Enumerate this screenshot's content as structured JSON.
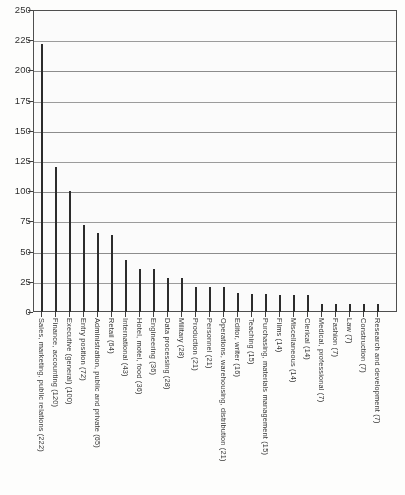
{
  "chart_data": {
    "type": "bar",
    "title": "",
    "subtitle": "",
    "xlabel": "",
    "ylabel": "",
    "ylim": [
      0,
      250
    ],
    "ytick_step": 25,
    "grid": true,
    "legend": false,
    "orientation": "vertical",
    "sorted": "descending",
    "yticks": [
      "0",
      "25",
      "50",
      "75",
      "100",
      "125",
      "150",
      "175",
      "200",
      "225",
      "250"
    ],
    "ytick_values": [
      0,
      25,
      50,
      75,
      100,
      125,
      150,
      175,
      200,
      225,
      250
    ],
    "categories": [
      "Sales, marketing, public relations (222)",
      "Finance, accounting (120)",
      "Executive (general) (100)",
      "Entry position (72)",
      "Administration, public and private (65)",
      "Retail (64)",
      "International (43)",
      "Hotel, motel, food (36)",
      "Engineering (36)",
      "Data processing (28)",
      "Military (28)",
      "Production (21)",
      "Personnel (21)",
      "Operations, warehousing, distribution (21)",
      "Editor, writer (16)",
      "Teaching (15)",
      "Purchasing, materials management (15)",
      "Films (14)",
      "Miscellaneous (14)",
      "Clerical (14)",
      "Medical, professional (7)",
      "Fashion (7)",
      "Law (7)",
      "Construction (7)",
      "Research and development (7)"
    ],
    "category_names": [
      "Sales, marketing, public relations",
      "Finance, accounting",
      "Executive (general)",
      "Entry position",
      "Administration, public and private",
      "Retail",
      "International",
      "Hotel, motel, food",
      "Engineering",
      "Data processing",
      "Military",
      "Production",
      "Personnel",
      "Operations, warehousing, distribution",
      "Editor, writer",
      "Teaching",
      "Purchasing, materials management",
      "Films",
      "Miscellaneous",
      "Clerical",
      "Medical, professional",
      "Fashion",
      "Law",
      "Construction",
      "Research and development"
    ],
    "values": [
      222,
      120,
      100,
      72,
      65,
      64,
      43,
      36,
      36,
      28,
      28,
      21,
      21,
      21,
      16,
      15,
      15,
      14,
      14,
      14,
      7,
      7,
      7,
      7,
      7
    ],
    "bar_color": "#252525"
  }
}
